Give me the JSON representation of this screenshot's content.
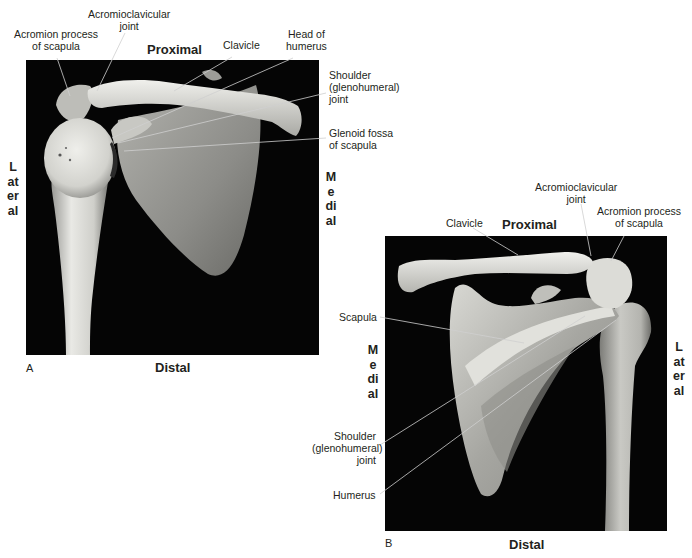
{
  "figure": {
    "panels": [
      {
        "id": "A",
        "letter": "A",
        "directions": {
          "top": "Proximal",
          "bottom": "Distal",
          "left": "Lateral",
          "right": "Medial"
        },
        "labels": {
          "acromion": [
            "Acromion process",
            "of scapula"
          ],
          "ac_joint": [
            "Acromioclavicular",
            "joint"
          ],
          "clavicle": [
            "Clavicle"
          ],
          "head_humerus": [
            "Head of",
            "humerus"
          ],
          "shoulder_joint": [
            "Shoulder",
            "(glenohumeral)",
            "joint"
          ],
          "glenoid": [
            "Glenoid fossa",
            "of scapula"
          ]
        }
      },
      {
        "id": "B",
        "letter": "B",
        "directions": {
          "top": "Proximal",
          "bottom": "Distal",
          "left": "Medial",
          "right": "Lateral"
        },
        "labels": {
          "clavicle": [
            "Clavicle"
          ],
          "ac_joint": [
            "Acromioclavicular",
            "joint"
          ],
          "acromion": [
            "Acromion process",
            "of scapula"
          ],
          "scapula": [
            "Scapula"
          ],
          "shoulder_joint": [
            "Shoulder",
            "(glenohumeral)",
            "joint"
          ],
          "humerus": [
            "Humerus"
          ]
        }
      }
    ],
    "colors": {
      "photo_background": "#050505",
      "bone_light": "#e8e8e4",
      "bone_mid": "#b9b9b4",
      "bone_shadow": "#7e7e7a",
      "leader_line": "#3a3a3a",
      "text": "#231f20"
    }
  }
}
